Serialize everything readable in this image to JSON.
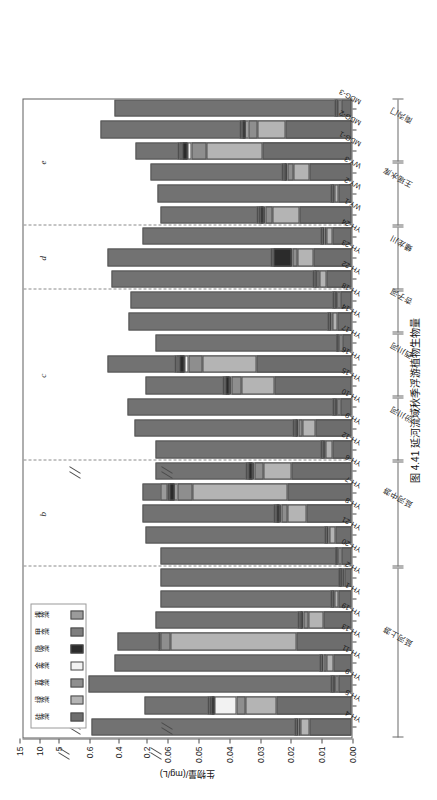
{
  "caption": "图 4.41  延河流域秋季浮游植物生物量",
  "axes": {
    "value_axis_title": "生物量/(mg/L)",
    "value_ticks": [
      "0.00",
      "0.01",
      "0.02",
      "0.03",
      "0.04",
      "0.05",
      "0.06",
      "0.2",
      "0.4",
      "0.6",
      "5",
      "10",
      "15"
    ],
    "value_segments": [
      {
        "min": 0.0,
        "max": 0.06,
        "ticks": [
          "0.00",
          "0.01",
          "0.02",
          "0.03",
          "0.04",
          "0.05",
          "0.06"
        ]
      },
      {
        "min": 0.1,
        "max": 0.7,
        "ticks": [
          "0.2",
          "0.4",
          "0.6"
        ]
      },
      {
        "min": 2.5,
        "max": 17.5,
        "ticks": [
          "5",
          "10",
          "15"
        ]
      }
    ],
    "break_marks": 2,
    "grid": "off"
  },
  "legend": {
    "position": "top-left-inside",
    "items": [
      {
        "label": "硅藻",
        "color": "#6d6d6d"
      },
      {
        "label": "绿藻",
        "color": "#b4b4b4"
      },
      {
        "label": "蓝藻",
        "color": "#8e8e8e"
      },
      {
        "label": "金藻",
        "color": "#f2f2f2"
      },
      {
        "label": "隐藻",
        "color": "#2b2b2b"
      },
      {
        "label": "甲藻",
        "color": "#7e7e7e"
      },
      {
        "label": "裸藻",
        "color": "#9b9b9b"
      }
    ]
  },
  "panels": [
    {
      "letter": "a"
    },
    {
      "letter": "b"
    },
    {
      "letter": "c"
    },
    {
      "letter": "d"
    },
    {
      "letter": "e"
    }
  ],
  "reaches": [
    {
      "label": "延河上游",
      "sites": [
        "YH-4",
        "YH-5",
        "YH-9",
        "YH-11",
        "YH-13",
        "YH-19",
        "YH-1",
        "YH-2"
      ]
    },
    {
      "label": "延河中游",
      "sites": [
        "YH-20",
        "YH-21",
        "YH-8",
        "YH-7",
        "YH-6"
      ]
    },
    {
      "label": "汾川河",
      "sites": [
        "YH-12",
        "YH-9",
        "YH-10"
      ]
    },
    {
      "label": "西川河",
      "sites": [
        "YH-15",
        "YH-16",
        "YH-17"
      ]
    },
    {
      "label": "杏子河",
      "sites": [
        "YH-14",
        "YH-18"
      ]
    },
    {
      "label": "蟠龙川",
      "sites": [
        "YH-22",
        "YH-23",
        "YH-24"
      ]
    },
    {
      "label": "王瑶水库",
      "sites": [
        "WY-1",
        "WY-2",
        "WY-3"
      ]
    },
    {
      "label": "南沟门",
      "sites": [
        "MDG-1",
        "MDG-2",
        "MDG-3"
      ]
    }
  ],
  "chart_data": {
    "type": "bar",
    "orientation": "vertical-stacked",
    "title": "图 4.41  延河流域秋季浮游植物生物量",
    "xlabel": "",
    "ylabel": "生物量/(mg/L)",
    "ylim": [
      0,
      17.5
    ],
    "broken_axis": true,
    "categories": [
      "YH-4",
      "YH-5",
      "YH-9",
      "YH-11",
      "YH-13",
      "YH-19",
      "YH-1",
      "YH-2",
      "YH-20",
      "YH-21",
      "YH-8",
      "YH-7",
      "YH-6",
      "YH-12",
      "YH-9",
      "YH-10",
      "YH-15",
      "YH-16",
      "YH-17",
      "YH-14",
      "YH-18",
      "YH-22",
      "YH-23",
      "YH-24",
      "WY-1",
      "WY-2",
      "WY-3",
      "MDG-1",
      "MDG-2",
      "MDG-3"
    ],
    "series": [
      {
        "name": "硅藻",
        "color": "#6d6d6d",
        "values": [
          0.0135,
          0.0245,
          0.0041,
          0.006,
          0.0178,
          0.009,
          0.0042,
          0.0022,
          0.0031,
          0.0051,
          0.0145,
          0.0207,
          0.0195,
          0.0063,
          0.0118,
          0.0036,
          0.025,
          0.031,
          0.0029,
          0.0047,
          0.0036,
          0.0081,
          0.0124,
          0.0061,
          0.017,
          0.0042,
          0.0135,
          0.029,
          0.0215,
          0.0031
        ]
      },
      {
        "name": "绿藻",
        "color": "#b4b4b4",
        "values": [
          0.003,
          0.01,
          0.0012,
          0.0022,
          0.041,
          0.005,
          0.0012,
          0.0008,
          0.001,
          0.0019,
          0.0062,
          0.031,
          0.009,
          0.002,
          0.004,
          0.0011,
          0.0108,
          0.0175,
          0.0009,
          0.0014,
          0.0011,
          0.0024,
          0.0052,
          0.002,
          0.0085,
          0.0012,
          0.0054,
          0.018,
          0.009,
          0.001
        ]
      },
      {
        "name": "蓝藻",
        "color": "#8e8e8e",
        "values": [
          0.0008,
          0.003,
          0.0005,
          0.0009,
          0.006,
          0.0016,
          0.0004,
          0.0003,
          0.0004,
          0.0006,
          0.0021,
          0.0048,
          0.003,
          0.0007,
          0.0014,
          0.0004,
          0.0031,
          0.0045,
          0.0003,
          0.0005,
          0.0004,
          0.0008,
          0.0016,
          0.0007,
          0.0025,
          0.0004,
          0.0018,
          0.005,
          0.003,
          0.0004
        ]
      },
      {
        "name": "金藻",
        "color": "#f2f2f2",
        "values": [
          0.0002,
          0.007,
          0.0002,
          0.0003,
          0.0012,
          0.0004,
          0.0001,
          0.0001,
          0.0001,
          0.0002,
          0.0006,
          0.0011,
          0.0008,
          0.0002,
          0.0004,
          0.0001,
          0.0008,
          0.0012,
          0.0001,
          0.0002,
          0.0001,
          0.0002,
          0.0004,
          0.0002,
          0.0007,
          0.0001,
          0.0005,
          0.0013,
          0.0008,
          0.0001
        ]
      },
      {
        "name": "隐藻",
        "color": "#2b2b2b",
        "values": [
          0.0003,
          0.0009,
          0.0002,
          0.0003,
          0.0018,
          0.0006,
          0.0002,
          0.0001,
          0.0001,
          0.0002,
          0.0008,
          0.0015,
          0.001,
          0.0002,
          0.0005,
          0.0002,
          0.0011,
          0.0016,
          0.0001,
          0.0002,
          0.0002,
          0.0003,
          0.0056,
          0.0003,
          0.0009,
          0.0002,
          0.0006,
          0.0017,
          0.001,
          0.0002
        ]
      },
      {
        "name": "甲藻",
        "color": "#7e7e7e",
        "values": [
          0.0002,
          0.0006,
          0.0001,
          0.0002,
          0.0009,
          0.0003,
          0.0001,
          0.0001,
          0.0001,
          0.0001,
          0.0004,
          0.0008,
          0.0005,
          0.0001,
          0.0003,
          0.0001,
          0.0006,
          0.0009,
          0.0001,
          0.0001,
          0.0001,
          0.0002,
          0.0003,
          0.0002,
          0.0005,
          0.0001,
          0.0003,
          0.0009,
          0.0005,
          0.0001
        ]
      },
      {
        "name": "裸藻",
        "color": "#9b9b9b",
        "values": [
          0.0001,
          0.0004,
          0.0001,
          0.0001,
          0.0006,
          0.0002,
          0.0001,
          0.0,
          0.0,
          0.0001,
          0.0003,
          0.0005,
          0.0003,
          0.0001,
          0.0002,
          0.0001,
          0.0004,
          0.0006,
          0.0,
          0.0001,
          0.0001,
          0.0001,
          0.0002,
          0.0001,
          0.0003,
          0.0001,
          0.0002,
          0.0006,
          0.0003,
          0.0001
        ]
      }
    ],
    "total_overlay": [
      0.58,
      0.21,
      0.6,
      0.42,
      0.4,
      0.13,
      0.085,
      0.085,
      0.078,
      0.2,
      0.22,
      0.22,
      0.13,
      0.13,
      0.28,
      0.33,
      0.2,
      0.47,
      0.13,
      0.32,
      0.31,
      0.44,
      0.47,
      0.22,
      0.095,
      0.12,
      0.17,
      0.27,
      0.52,
      0.42
    ]
  }
}
